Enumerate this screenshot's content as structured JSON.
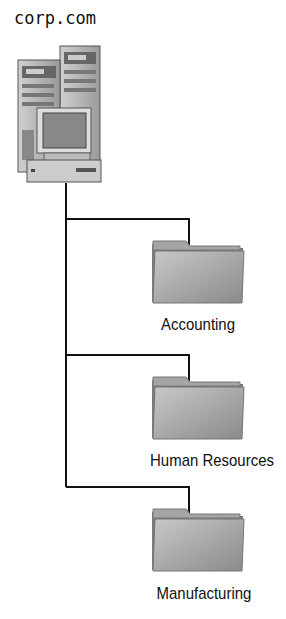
{
  "root": {
    "label": "corp.com",
    "icon": "server-icon"
  },
  "folders": [
    {
      "label": "Accounting",
      "icon": "folder-icon"
    },
    {
      "label": "Human Resources",
      "icon": "folder-icon"
    },
    {
      "label": "Manufacturing",
      "icon": "folder-icon"
    }
  ],
  "colors": {
    "line": "#111111",
    "folder": "#9a9a9a",
    "server": "#b5b5b5"
  }
}
